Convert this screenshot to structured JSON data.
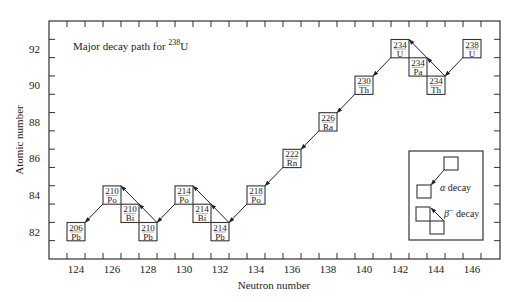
{
  "chart_data": {
    "type": "scatter",
    "title": "Major decay path for 238U",
    "title_parts": {
      "prefix": "Major decay path for ",
      "mass": "238",
      "element": "U"
    },
    "xlabel": "Neutron number",
    "ylabel": "Atomic number",
    "xlim": [
      122.5,
      147.5
    ],
    "ylim": [
      81,
      93.5
    ],
    "x_ticks": [
      124,
      126,
      128,
      130,
      132,
      134,
      136,
      138,
      140,
      142,
      144,
      146
    ],
    "y_ticks": [
      82,
      84,
      86,
      88,
      90,
      92
    ],
    "grid": false,
    "nuclides": [
      {
        "id": "U238",
        "A": "238",
        "symbol": "U",
        "N": 146,
        "Z": 92
      },
      {
        "id": "Th234",
        "A": "234",
        "symbol": "Th",
        "N": 144,
        "Z": 90
      },
      {
        "id": "Pa234",
        "A": "234",
        "symbol": "Pa",
        "N": 143,
        "Z": 91
      },
      {
        "id": "U234",
        "A": "234",
        "symbol": "U",
        "N": 142,
        "Z": 92
      },
      {
        "id": "Th230",
        "A": "230",
        "symbol": "Th",
        "N": 140,
        "Z": 90
      },
      {
        "id": "Ra226",
        "A": "226",
        "symbol": "Ra",
        "N": 138,
        "Z": 88
      },
      {
        "id": "Rn222",
        "A": "222",
        "symbol": "Rn",
        "N": 136,
        "Z": 86
      },
      {
        "id": "Po218",
        "A": "218",
        "symbol": "Po",
        "N": 134,
        "Z": 84
      },
      {
        "id": "Pb214",
        "A": "214",
        "symbol": "Pb",
        "N": 132,
        "Z": 82
      },
      {
        "id": "Bi214",
        "A": "214",
        "symbol": "Bi",
        "N": 131,
        "Z": 83
      },
      {
        "id": "Po214",
        "A": "214",
        "symbol": "Po",
        "N": 130,
        "Z": 84
      },
      {
        "id": "Pb210",
        "A": "210",
        "symbol": "Pb",
        "N": 128,
        "Z": 82
      },
      {
        "id": "Bi210",
        "A": "210",
        "symbol": "Bi",
        "N": 127,
        "Z": 83
      },
      {
        "id": "Po210",
        "A": "210",
        "symbol": "Po",
        "N": 126,
        "Z": 84
      },
      {
        "id": "Pb206",
        "A": "206",
        "symbol": "Pb",
        "N": 124,
        "Z": 82
      }
    ],
    "decays": [
      {
        "from": "U238",
        "to": "Th234",
        "type": "alpha"
      },
      {
        "from": "Th234",
        "to": "Pa234",
        "type": "beta"
      },
      {
        "from": "Pa234",
        "to": "U234",
        "type": "beta"
      },
      {
        "from": "U234",
        "to": "Th230",
        "type": "alpha"
      },
      {
        "from": "Th230",
        "to": "Ra226",
        "type": "alpha"
      },
      {
        "from": "Ra226",
        "to": "Rn222",
        "type": "alpha"
      },
      {
        "from": "Rn222",
        "to": "Po218",
        "type": "alpha"
      },
      {
        "from": "Po218",
        "to": "Pb214",
        "type": "alpha"
      },
      {
        "from": "Pb214",
        "to": "Bi214",
        "type": "beta"
      },
      {
        "from": "Bi214",
        "to": "Po214",
        "type": "beta"
      },
      {
        "from": "Po214",
        "to": "Pb210",
        "type": "alpha"
      },
      {
        "from": "Pb210",
        "to": "Bi210",
        "type": "beta"
      },
      {
        "from": "Bi210",
        "to": "Po210",
        "type": "beta"
      },
      {
        "from": "Po210",
        "to": "Pb206",
        "type": "alpha"
      }
    ],
    "legend": {
      "position": "lower right",
      "entries": [
        {
          "type": "alpha",
          "label_symbol": "α",
          "label_text": " decay"
        },
        {
          "type": "beta",
          "label_symbol": "β",
          "label_sup": "−",
          "label_text": " decay"
        }
      ]
    }
  }
}
